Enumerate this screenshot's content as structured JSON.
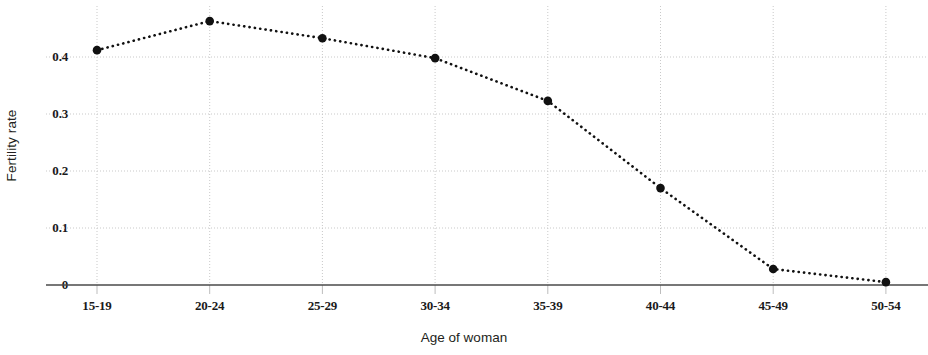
{
  "chart_data": {
    "type": "line",
    "title": "",
    "xlabel": "Age of woman",
    "ylabel": "Fertility rate",
    "categories": [
      "15-19",
      "20-24",
      "25-29",
      "30-34",
      "35-39",
      "40-44",
      "45-49",
      "50-54"
    ],
    "values": [
      0.412,
      0.463,
      0.433,
      0.398,
      0.323,
      0.17,
      0.028,
      0.005
    ],
    "ylim": [
      0,
      0.5
    ],
    "y_ticks": [
      0,
      0.1,
      0.2,
      0.3,
      0.4
    ],
    "y_tick_labels": [
      "0",
      "0.1",
      "0.2",
      "0.3",
      "0.4"
    ],
    "grid": true,
    "legend": false,
    "line_style": "dotted",
    "marker": "circle",
    "series_color": "#111111",
    "grid_color": "#c9c9c9",
    "axis_color": "#4a4a4a"
  },
  "axes": {
    "y_title": "Fertility rate",
    "x_title": "Age of woman"
  }
}
